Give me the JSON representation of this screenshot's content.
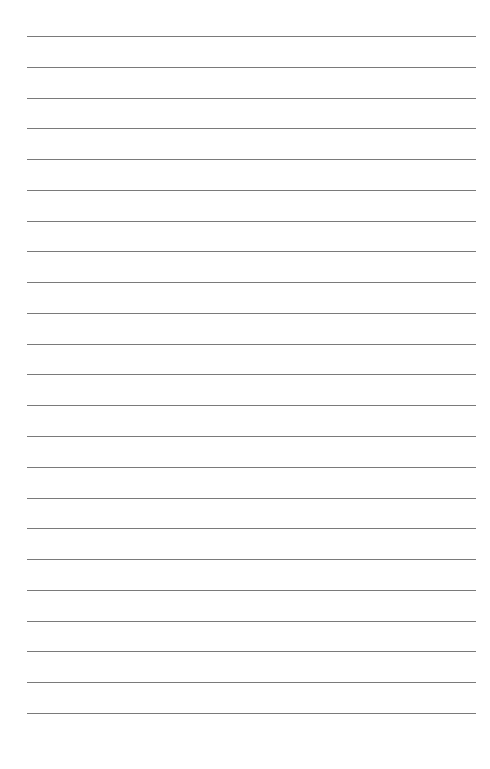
{
  "page": {
    "type": "lined-paper",
    "line_count": 23,
    "first_line_y": 36,
    "line_spacing": 30.77,
    "line_left": 27,
    "line_width": 449,
    "line_color": "#7a7a7a",
    "background": "#ffffff"
  }
}
